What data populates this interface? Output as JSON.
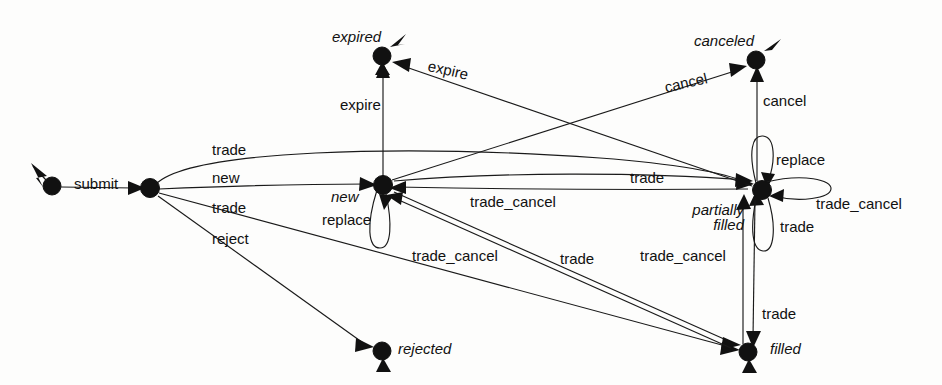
{
  "diagram": {
    "type": "state-machine",
    "states": [
      {
        "id": "start",
        "label": "",
        "x": 52,
        "y": 186,
        "kind": "initial"
      },
      {
        "id": "submitted",
        "label": "",
        "x": 150,
        "y": 188,
        "kind": "state"
      },
      {
        "id": "new",
        "label": "new",
        "x": 383,
        "y": 185,
        "kind": "state"
      },
      {
        "id": "expired",
        "label": "expired",
        "x": 382,
        "y": 56,
        "kind": "final"
      },
      {
        "id": "canceled",
        "label": "canceled",
        "x": 756,
        "y": 60,
        "kind": "final"
      },
      {
        "id": "partially_filled",
        "label": "partially\nfilled",
        "x": 762,
        "y": 190,
        "kind": "state"
      },
      {
        "id": "filled",
        "label": "filled",
        "x": 748,
        "y": 352,
        "kind": "final"
      },
      {
        "id": "rejected",
        "label": "rejected",
        "x": 382,
        "y": 351,
        "kind": "final"
      }
    ],
    "transitions": [
      {
        "id": "t-submit",
        "label": "submit",
        "from": "start",
        "to": "submitted"
      },
      {
        "id": "t-new",
        "label": "new",
        "from": "submitted",
        "to": "new"
      },
      {
        "id": "t-trade-pf",
        "label": "trade",
        "from": "submitted",
        "to": "partially_filled"
      },
      {
        "id": "t-trade-filled",
        "label": "trade",
        "from": "submitted",
        "to": "filled"
      },
      {
        "id": "t-reject",
        "label": "reject",
        "from": "submitted",
        "to": "rejected"
      },
      {
        "id": "t-expire-new",
        "label": "expire",
        "from": "new",
        "to": "expired"
      },
      {
        "id": "t-expire-pf",
        "label": "expire",
        "from": "partially_filled",
        "to": "expired"
      },
      {
        "id": "t-cancel-new",
        "label": "cancel",
        "from": "new",
        "to": "canceled"
      },
      {
        "id": "t-cancel-pf",
        "label": "cancel",
        "from": "partially_filled",
        "to": "canceled"
      },
      {
        "id": "t-replace-new",
        "label": "replace",
        "from": "new",
        "to": "new"
      },
      {
        "id": "t-replace-pf",
        "label": "replace",
        "from": "partially_filled",
        "to": "partially_filled"
      },
      {
        "id": "t-trade-new-pf",
        "label": "trade",
        "from": "new",
        "to": "partially_filled"
      },
      {
        "id": "t-tc-pf-new",
        "label": "trade_cancel",
        "from": "partially_filled",
        "to": "new"
      },
      {
        "id": "t-tc-pf-self",
        "label": "trade_cancel",
        "from": "partially_filled",
        "to": "partially_filled"
      },
      {
        "id": "t-trade-pf-self",
        "label": "trade",
        "from": "partially_filled",
        "to": "partially_filled"
      },
      {
        "id": "t-trade-new-f",
        "label": "trade",
        "from": "new",
        "to": "filled"
      },
      {
        "id": "t-tc-f-new",
        "label": "trade_cancel",
        "from": "filled",
        "to": "new"
      },
      {
        "id": "t-trade-pf-f",
        "label": "trade",
        "from": "partially_filled",
        "to": "filled"
      },
      {
        "id": "t-tc-f-pf",
        "label": "trade_cancel",
        "from": "filled",
        "to": "partially_filled"
      }
    ],
    "edge_labels": [
      {
        "id": "lbl-submit",
        "text": "submit",
        "x": 74,
        "y": 176,
        "rotate": 0
      },
      {
        "id": "lbl-trade-top",
        "text": "trade",
        "x": 212,
        "y": 142,
        "rotate": 0
      },
      {
        "id": "lbl-new",
        "text": "new",
        "x": 212,
        "y": 170,
        "rotate": 0
      },
      {
        "id": "lbl-trade-mid",
        "text": "trade",
        "x": 212,
        "y": 200,
        "rotate": 0
      },
      {
        "id": "lbl-reject",
        "text": "reject",
        "x": 212,
        "y": 231,
        "rotate": 0
      },
      {
        "id": "lbl-expire-v",
        "text": "expire",
        "x": 340,
        "y": 97,
        "rotate": 0
      },
      {
        "id": "lbl-expire-d",
        "text": "expire",
        "x": 430,
        "y": 58,
        "rotate": 13
      },
      {
        "id": "lbl-cancel-d",
        "text": "cancel",
        "x": 663,
        "y": 68,
        "rotate": -13
      },
      {
        "id": "lbl-cancel-v",
        "text": "cancel",
        "x": 763,
        "y": 93,
        "rotate": 0
      },
      {
        "id": "lbl-replace-new",
        "text": "replace",
        "x": 322,
        "y": 212,
        "rotate": 0
      },
      {
        "id": "lbl-replace-pf",
        "text": "replace",
        "x": 776,
        "y": 152,
        "rotate": 0
      },
      {
        "id": "lbl-trade-long",
        "text": "trade",
        "x": 630,
        "y": 170,
        "rotate": 0
      },
      {
        "id": "lbl-tc-pfnew",
        "text": "trade_cancel",
        "x": 470,
        "y": 194,
        "rotate": 0
      },
      {
        "id": "lbl-tc-right",
        "text": "trade_cancel",
        "x": 816,
        "y": 196,
        "rotate": 0
      },
      {
        "id": "lbl-trade-right",
        "text": "trade",
        "x": 780,
        "y": 219,
        "rotate": 0
      },
      {
        "id": "lbl-tc-diag",
        "text": "trade_cancel",
        "x": 412,
        "y": 248,
        "rotate": 0
      },
      {
        "id": "lbl-trade-diag",
        "text": "trade",
        "x": 560,
        "y": 251,
        "rotate": 0
      },
      {
        "id": "lbl-tc-vert",
        "text": "trade_cancel",
        "x": 640,
        "y": 248,
        "rotate": 0
      },
      {
        "id": "lbl-trade-vert",
        "text": "trade",
        "x": 762,
        "y": 306,
        "rotate": 0
      }
    ],
    "state_labels": [
      {
        "id": "sl-expired",
        "text": "expired",
        "x": 332,
        "y": 29,
        "align": "left"
      },
      {
        "id": "sl-canceled",
        "text": "canceled",
        "x": 694,
        "y": 33,
        "align": "left"
      },
      {
        "id": "sl-new",
        "text": "new",
        "x": 331,
        "y": 189,
        "align": "left"
      },
      {
        "id": "sl-pf-1",
        "text": "partially",
        "x": 682,
        "y": 202,
        "align": "right"
      },
      {
        "id": "sl-pf-2",
        "text": "filled",
        "x": 682,
        "y": 216,
        "align": "right"
      },
      {
        "id": "sl-filled",
        "text": "filled",
        "x": 770,
        "y": 341,
        "align": "left"
      },
      {
        "id": "sl-rejected",
        "text": "rejected",
        "x": 398,
        "y": 341,
        "align": "left"
      }
    ],
    "style": {
      "node_fill": "#111111",
      "edge_stroke": "#1a1a1a",
      "background": "#fdfdfc",
      "node_radius": 9
    }
  }
}
